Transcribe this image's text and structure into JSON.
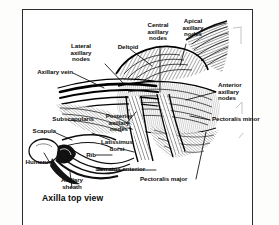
{
  "figure": {
    "title": "Axilla top view",
    "view_label": "Axilla top view",
    "style": "grayscale anatomical line engraving",
    "frame_color": "#2c2c2c",
    "background_color": "#ffffff",
    "ink_color": "#111111"
  },
  "labels": [
    {
      "id": "lateral-axillary-nodes",
      "text": "Lateral\naxillary\nnodes"
    },
    {
      "id": "central-axillary-nodes",
      "text": "Central\naxillary\nnodes"
    },
    {
      "id": "apical-axillary-nodes",
      "text": "Apical\naxillary\nnodes"
    },
    {
      "id": "deltoid",
      "text": "Deltoid"
    },
    {
      "id": "axillary-vein",
      "text": "Axillary vein"
    },
    {
      "id": "anterior-axillary-nodes",
      "text": "Anterior\naxillary\nnodes"
    },
    {
      "id": "pectoralis-minor",
      "text": "Pectoralis minor"
    },
    {
      "id": "subscapularis",
      "text": "Subscapularis"
    },
    {
      "id": "posterior-axillary-nodes",
      "text": "Posterior\naxillary\nnodes"
    },
    {
      "id": "scapula",
      "text": "Scapula"
    },
    {
      "id": "latissimus-dorsi",
      "text": "Latissimus\ndorsi"
    },
    {
      "id": "rib",
      "text": "Rib"
    },
    {
      "id": "humerus",
      "text": "Humerus"
    },
    {
      "id": "serratus-anterior",
      "text": "Serratus anterior"
    },
    {
      "id": "axillary-sheath",
      "text": "Axillary\nsheath"
    },
    {
      "id": "pectoralis-major",
      "text": "Pectoralis major"
    }
  ]
}
